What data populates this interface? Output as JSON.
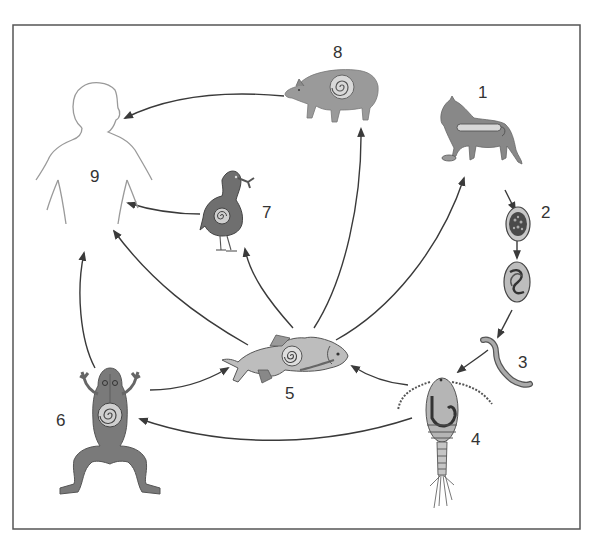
{
  "diagram": {
    "type": "life-cycle",
    "colors": {
      "frame": "#555555",
      "arrow": "#3a3a3a",
      "body_dark": "#6e6e6e",
      "body_mid": "#8c8c8c",
      "body_light": "#b8b8b8",
      "outline": "#9a9a9a"
    },
    "nodes": [
      {
        "id": "1",
        "label": "1",
        "subject": "cat"
      },
      {
        "id": "2",
        "label": "2",
        "subject": "eggs"
      },
      {
        "id": "3",
        "label": "3",
        "subject": "larva"
      },
      {
        "id": "4",
        "label": "4",
        "subject": "copepod"
      },
      {
        "id": "5",
        "label": "5",
        "subject": "fish"
      },
      {
        "id": "6",
        "label": "6",
        "subject": "frog"
      },
      {
        "id": "7",
        "label": "7",
        "subject": "bird"
      },
      {
        "id": "8",
        "label": "8",
        "subject": "pig"
      },
      {
        "id": "9",
        "label": "9",
        "subject": "human"
      }
    ],
    "edges": [
      {
        "from": "1",
        "to": "2"
      },
      {
        "from": "2",
        "to": "2b"
      },
      {
        "from": "2b",
        "to": "3"
      },
      {
        "from": "3",
        "to": "4"
      },
      {
        "from": "4",
        "to": "5"
      },
      {
        "from": "4",
        "to": "6"
      },
      {
        "from": "6",
        "to": "5"
      },
      {
        "from": "6",
        "to": "9"
      },
      {
        "from": "5",
        "to": "9"
      },
      {
        "from": "5",
        "to": "7"
      },
      {
        "from": "5",
        "to": "8"
      },
      {
        "from": "5",
        "to": "1"
      },
      {
        "from": "7",
        "to": "9"
      },
      {
        "from": "8",
        "to": "9"
      }
    ]
  }
}
